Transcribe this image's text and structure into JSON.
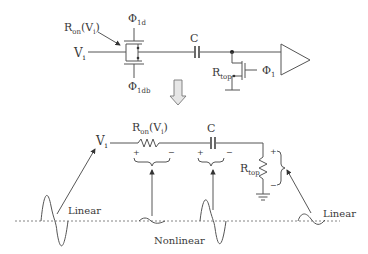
{
  "top_circuit": {
    "input_label": "V",
    "input_sub": "i",
    "switch_resistance_label": "R",
    "switch_resistance_sub": "on",
    "switch_resistance_arg": "(V",
    "switch_resistance_arg_sub": "i",
    "switch_resistance_arg_close": ")",
    "phi_top": "Φ",
    "phi_top_sub": "1d",
    "phi_bottom": "Φ",
    "phi_bottom_sub": "1db",
    "capacitor_label": "C",
    "rtop_label": "R",
    "rtop_sub": "top",
    "phi_right": "Φ",
    "phi_right_sub": "1"
  },
  "bottom_circuit": {
    "input_label": "V",
    "input_sub": "i",
    "resistor_label": "R",
    "resistor_sub": "on",
    "resistor_arg": "(V",
    "resistor_arg_sub": "i",
    "resistor_arg_close": ")",
    "capacitor_label": "C",
    "rtop_label": "R",
    "rtop_sub": "top",
    "plus": "+",
    "minus": "−"
  },
  "waveform_labels": {
    "input": "Linear",
    "middle": "Nonlinear",
    "output": "Linear"
  },
  "colors": {
    "line": "#555555",
    "text": "#3a3a3a",
    "arrow_fill": "#e6e6e6"
  }
}
